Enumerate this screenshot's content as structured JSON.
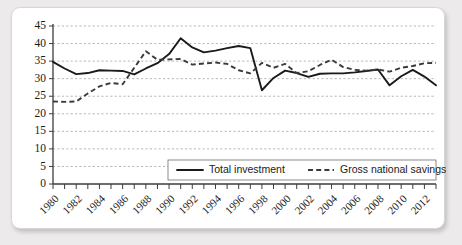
{
  "chart_data": {
    "type": "line",
    "title": "",
    "xlabel": "",
    "ylabel": "",
    "x": [
      1980,
      1981,
      1982,
      1983,
      1984,
      1985,
      1986,
      1987,
      1988,
      1989,
      1990,
      1991,
      1992,
      1993,
      1994,
      1995,
      1996,
      1997,
      1998,
      1999,
      2000,
      2001,
      2002,
      2003,
      2004,
      2005,
      2006,
      2007,
      2008,
      2009,
      2010,
      2011,
      2012,
      2013
    ],
    "xlim": [
      1980,
      2013
    ],
    "ylim": [
      0,
      45
    ],
    "yticks": [
      0,
      5,
      10,
      15,
      20,
      25,
      30,
      35,
      40,
      45
    ],
    "xtick_labels": [
      "1980",
      "1982",
      "1984",
      "1986",
      "1988",
      "1990",
      "1992",
      "1994",
      "1996",
      "1998",
      "2000",
      "2002",
      "2004",
      "2006",
      "2008",
      "2010",
      "2012"
    ],
    "xtick_label_years": [
      1980,
      1982,
      1984,
      1986,
      1988,
      1990,
      1992,
      1994,
      1996,
      1998,
      2000,
      2002,
      2004,
      2006,
      2008,
      2010,
      2012
    ],
    "grid": true,
    "grid_axis": "y",
    "legend_position": "bottom-center",
    "series": [
      {
        "name": "Total investment",
        "style": "solid",
        "color": "#1a1a1a",
        "values": [
          34.8,
          32.9,
          31.3,
          31.6,
          32.4,
          32.3,
          32.2,
          31.2,
          32.9,
          34.4,
          37.0,
          41.5,
          38.9,
          37.5,
          38.0,
          38.7,
          39.3,
          38.7,
          26.7,
          30.2,
          32.3,
          31.6,
          30.5,
          31.4,
          31.5,
          31.5,
          31.8,
          32.2,
          32.6,
          28.1,
          30.7,
          32.5,
          30.6,
          28.1
        ]
      },
      {
        "name": "Gross national savings",
        "style": "dashed",
        "color": "#3a3a3a",
        "values": [
          23.5,
          23.4,
          23.5,
          25.8,
          27.8,
          28.8,
          28.4,
          33.1,
          37.8,
          35.4,
          35.5,
          35.6,
          34.0,
          34.3,
          34.6,
          34.2,
          32.4,
          31.5,
          34.5,
          33.1,
          34.2,
          31.6,
          32.1,
          33.9,
          35.4,
          33.3,
          32.5,
          32.3,
          32.6,
          32.0,
          33.1,
          33.6,
          34.4,
          34.5
        ]
      }
    ]
  },
  "legend": {
    "entries": [
      {
        "label": "Total investment",
        "style": "solid"
      },
      {
        "label": "Gross national savings",
        "style": "dashed"
      }
    ]
  }
}
